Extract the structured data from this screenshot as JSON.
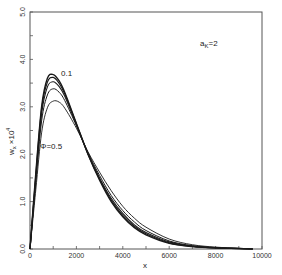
{
  "chart_data": {
    "type": "line",
    "title": "",
    "xlabel": "x",
    "ylabel": "w_x ×10^4",
    "xlim": [
      0,
      10000
    ],
    "ylim": [
      0,
      5.0
    ],
    "grid": false,
    "legend": "none (inline annotations)",
    "x_ticks": [
      "0",
      "2000",
      "4000",
      "6000",
      "8000",
      "10000"
    ],
    "y_ticks": [
      "0.0",
      "1.0",
      "2.0",
      "3.0",
      "4.0",
      "5.0"
    ],
    "annotations": [
      {
        "text": "a_K=2",
        "x": 7300,
        "y": 4.45
      },
      {
        "text": "0.1",
        "x": 1500,
        "y": 3.72,
        "note": "label of top curve (Φ=0.1)"
      },
      {
        "text": "Φ=0.5",
        "x": 400,
        "y": 2.45,
        "note": "label of lowest-peak curve"
      }
    ],
    "x": [
      0,
      250,
      500,
      750,
      1000,
      1250,
      1500,
      2000,
      2500,
      3000,
      3500,
      4000,
      4500,
      5000,
      6000,
      7000,
      8000,
      9000,
      9600
    ],
    "series": [
      {
        "name": "Φ=0.1",
        "values": [
          0,
          1.6,
          3.0,
          3.6,
          3.68,
          3.55,
          3.3,
          2.65,
          2.0,
          1.45,
          1.0,
          0.68,
          0.45,
          0.3,
          0.12,
          0.05,
          0.02,
          0.01,
          0.0
        ]
      },
      {
        "name": "Φ=0.2",
        "values": [
          0,
          1.55,
          2.95,
          3.52,
          3.62,
          3.5,
          3.27,
          2.64,
          2.0,
          1.47,
          1.03,
          0.71,
          0.48,
          0.32,
          0.13,
          0.055,
          0.022,
          0.01,
          0.0
        ]
      },
      {
        "name": "Φ=0.3",
        "values": [
          0,
          1.5,
          2.85,
          3.42,
          3.53,
          3.43,
          3.22,
          2.62,
          2.01,
          1.5,
          1.07,
          0.75,
          0.51,
          0.35,
          0.15,
          0.06,
          0.025,
          0.01,
          0.0
        ]
      },
      {
        "name": "Φ=0.4",
        "values": [
          0,
          1.4,
          2.7,
          3.25,
          3.38,
          3.31,
          3.13,
          2.6,
          2.03,
          1.55,
          1.13,
          0.81,
          0.57,
          0.39,
          0.17,
          0.07,
          0.03,
          0.012,
          0.0
        ]
      },
      {
        "name": "Φ=0.5",
        "values": [
          0,
          1.25,
          2.45,
          2.98,
          3.12,
          3.1,
          2.97,
          2.55,
          2.05,
          1.62,
          1.23,
          0.9,
          0.65,
          0.46,
          0.21,
          0.09,
          0.04,
          0.015,
          0.0
        ]
      }
    ]
  },
  "labels": {
    "annotation_ak": "a",
    "annotation_ak_sub": "K",
    "annotation_ak_rest": "=2",
    "curve_top_label": "0.1",
    "curve_bottom_label": "Φ=0.5",
    "x_axis_label": "x",
    "y_axis_label_main": "w",
    "y_axis_label_sub": "x",
    "y_axis_label_mult": "×10",
    "y_axis_label_exp": "4"
  }
}
